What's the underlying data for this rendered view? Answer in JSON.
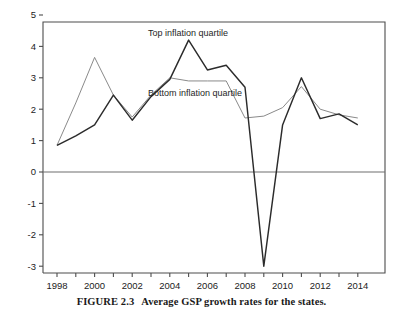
{
  "figure": {
    "number_label": "FIGURE 2.3",
    "caption_text": "Average GSP growth rates for the states."
  },
  "annotations": {
    "top_series_label": "Top inflation quartile",
    "bottom_series_label": "Bottom inflation quartile"
  },
  "axes": {
    "y_ticks": [
      "5",
      "4",
      "3",
      "2",
      "1",
      "0",
      "-1",
      "-2",
      "-3"
    ],
    "x_ticks": [
      "1998",
      "2000",
      "2002",
      "2004",
      "2006",
      "2008",
      "2010",
      "2012",
      "2014"
    ]
  },
  "colors": {
    "top_series": "#2b2b2b",
    "bottom_series": "#8a8a8a",
    "frame": "#4d4d4d",
    "zero_line": "#6e6e6e",
    "text": "#1c1c1c"
  },
  "chart_data": {
    "type": "line",
    "title": "",
    "xlabel": "",
    "ylabel": "",
    "xlim": [
      1997,
      2015
    ],
    "ylim": [
      -3,
      5
    ],
    "grid": false,
    "legend_position": "inline-annotations",
    "x": [
      1998,
      1999,
      2000,
      2001,
      2002,
      2003,
      2004,
      2005,
      2006,
      2007,
      2008,
      2009,
      2010,
      2011,
      2012,
      2013,
      2014
    ],
    "y_tick_values": [
      5,
      4,
      3,
      2,
      1,
      0,
      -1,
      -2,
      -3
    ],
    "x_tick_values": [
      1998,
      2000,
      2002,
      2004,
      2006,
      2008,
      2010,
      2012,
      2014
    ],
    "x_minor_tick_values": [
      1999,
      2001,
      2003,
      2005,
      2007,
      2009,
      2011,
      2013
    ],
    "series": [
      {
        "name": "Top inflation quartile",
        "color": "#2b2b2b",
        "values": [
          0.85,
          1.15,
          1.5,
          2.45,
          1.65,
          2.4,
          2.95,
          4.2,
          3.25,
          3.4,
          2.7,
          -3.0,
          1.5,
          3.0,
          1.7,
          1.85,
          1.5
        ]
      },
      {
        "name": "Bottom inflation quartile",
        "color": "#8a8a8a",
        "values": [
          0.85,
          2.2,
          3.65,
          2.45,
          1.75,
          2.45,
          3.0,
          2.9,
          2.9,
          2.9,
          1.72,
          1.78,
          2.05,
          2.72,
          2.0,
          1.82,
          1.72
        ]
      }
    ]
  },
  "geometry": {
    "plot_left": 43,
    "plot_right": 385,
    "plot_top": 22,
    "plot_bottom": 273,
    "x_first": 57,
    "x_step": 18.8,
    "y_zero": 172,
    "y_unit": 31.4
  }
}
